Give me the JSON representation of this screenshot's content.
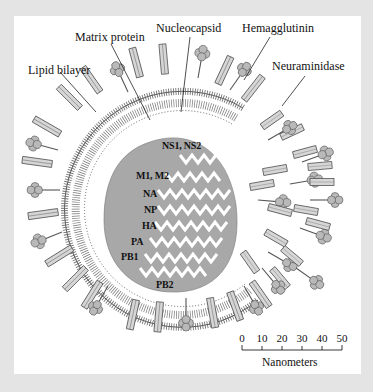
{
  "diagram": {
    "labels": {
      "matrix_protein": "Matrix protein",
      "nucleocapsid": "Nucleocapsid",
      "hemagglutinin": "Hemagglutinin",
      "neuraminidase": "Neuraminidase",
      "lipid_bilayer": "Lipid bilayer"
    },
    "rna_segments": [
      {
        "label": "NS1, NS2"
      },
      {
        "label": "M1, M2"
      },
      {
        "label": "NA"
      },
      {
        "label": "NP"
      },
      {
        "label": "HA"
      },
      {
        "label": "PA"
      },
      {
        "label": "PB1"
      },
      {
        "label": "PB2"
      }
    ],
    "scale_bar": {
      "ticks": [
        "0",
        "10",
        "20",
        "30",
        "40",
        "50"
      ],
      "unit": "Nanometers"
    },
    "colors": {
      "background": "#e4e4e4",
      "panel": "#ffffff",
      "core_fill": "#a8a8a8",
      "spike_fill": "#c8c8c8",
      "outline": "#555555",
      "text": "#111111"
    }
  }
}
